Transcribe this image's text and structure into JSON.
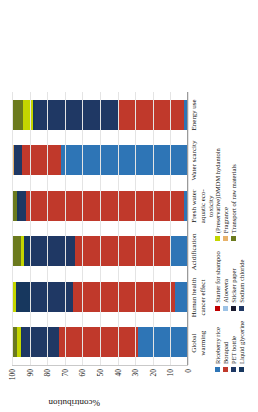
{
  "chart_data": {
    "type": "bar",
    "subtype": "stacked-bar-100",
    "title": "",
    "xlabel": "",
    "ylabel": "%contribution",
    "ylim": [
      0,
      100
    ],
    "yticks": [
      0,
      10,
      20,
      30,
      40,
      50,
      60,
      70,
      80,
      90,
      100
    ],
    "grid": true,
    "legend_position": "bottom",
    "categories": [
      "Global warming",
      "Human health cancer effect",
      "Acidification",
      "Fresh water aquatic eco-toxicity",
      "Water scarcity",
      "Energy use"
    ],
    "series": [
      {
        "name": "Riceberry rice",
        "color": "#2E75B6",
        "values": [
          28,
          7,
          9,
          2,
          72,
          2
        ]
      },
      {
        "name": "Borapad",
        "color": "#C0392B",
        "values": [
          45,
          58,
          55,
          91,
          22,
          37
        ]
      },
      {
        "name": "PET bottle",
        "color": "#1F3864",
        "values": [
          21,
          24,
          25,
          4,
          5,
          48
        ]
      },
      {
        "name": "Liquid glycerine",
        "color": "#17375E",
        "values": [
          1,
          9,
          4,
          1,
          0,
          1
        ]
      },
      {
        "name": "Starter for shampoo",
        "color": "#C00000",
        "values": [
          0,
          0,
          0,
          0,
          0,
          0
        ]
      },
      {
        "name": "Aloevera",
        "color": "#9DC3E6",
        "values": [
          0,
          0,
          0,
          0,
          0,
          0
        ]
      },
      {
        "name": "Sticker paper",
        "color": "#1A1A2E",
        "values": [
          0,
          0,
          0,
          0,
          0,
          0
        ]
      },
      {
        "name": "Sodium chloride",
        "color": "#203864",
        "values": [
          0,
          0,
          0,
          0,
          0,
          0
        ]
      },
      {
        "name": "(Preservative)DMDM hydantoin",
        "color": "#C4D600",
        "values": [
          2,
          2,
          2,
          0,
          0,
          6
        ]
      },
      {
        "name": "Fragrance",
        "color": "#E8B26B",
        "values": [
          0,
          0,
          0,
          0,
          1,
          0
        ]
      },
      {
        "name": "Transport of raw materials",
        "color": "#6B7A1E",
        "values": [
          3,
          0,
          5,
          3,
          0,
          6
        ]
      }
    ]
  },
  "axis": {
    "y_label": "%contribution",
    "y_ticks": [
      "100",
      "90",
      "80",
      "70",
      "60",
      "50",
      "40",
      "30",
      "20",
      "10",
      "0"
    ]
  },
  "legend": {
    "columns": [
      {
        "items": [
          {
            "label": "Riceberry rice",
            "color": "#2E75B6"
          },
          {
            "label": "Borapad",
            "color": "#C0392B"
          },
          {
            "label": "PET bottle",
            "color": "#1F3864"
          },
          {
            "label": "Liquid glycerine",
            "color": "#17375E"
          }
        ]
      },
      {
        "items": [
          {
            "label": "Starter for shampoo",
            "color": "#C00000"
          },
          {
            "label": "Aloevera",
            "color": "#9DC3E6"
          },
          {
            "label": "Sticker paper",
            "color": "#1A1A2E"
          },
          {
            "label": "Sodium chloride",
            "color": "#203864"
          }
        ]
      },
      {
        "items": [
          {
            "label": "(Preservative)DMDM hydantoin",
            "color": "#C4D600"
          },
          {
            "label": "Fragrance",
            "color": "#E8B26B"
          },
          {
            "label": "Transport of raw materials",
            "color": "#6B7A1E"
          }
        ]
      }
    ]
  }
}
